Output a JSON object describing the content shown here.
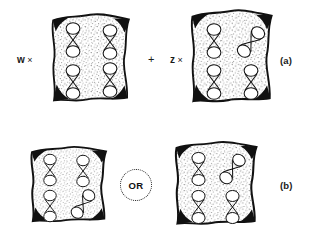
{
  "figure": {
    "background_color": "#ffffff",
    "ink_color": "#111111",
    "stipple_color": "#6b6b6b",
    "rows": [
      {
        "id": "row-a",
        "label": "(a)",
        "operator": "+",
        "items": [
          {
            "id": "cell-a1",
            "parent_label": "w",
            "cross_symbol": "×",
            "chromosome_count": 4,
            "chromosomes": [
              {
                "position": "top-left",
                "orientation": "vertical"
              },
              {
                "position": "top-right",
                "orientation": "vertical"
              },
              {
                "position": "bottom-left",
                "orientation": "vertical"
              },
              {
                "position": "bottom-right",
                "orientation": "vertical"
              }
            ]
          },
          {
            "id": "cell-a2",
            "parent_label": "z",
            "cross_symbol": "×",
            "chromosome_count": 4,
            "chromosomes": [
              {
                "position": "top-left",
                "orientation": "vertical"
              },
              {
                "position": "top-right",
                "orientation": "diagonal"
              },
              {
                "position": "bottom-left",
                "orientation": "vertical"
              },
              {
                "position": "bottom-right",
                "orientation": "vertical"
              }
            ]
          }
        ]
      },
      {
        "id": "row-b",
        "label": "(b)",
        "operator": "OR",
        "items": [
          {
            "id": "cell-b1",
            "parent_label": "",
            "cross_symbol": "",
            "chromosome_count": 4,
            "chromosomes": [
              {
                "position": "top-left",
                "orientation": "vertical"
              },
              {
                "position": "top-right",
                "orientation": "vertical"
              },
              {
                "position": "bottom-left",
                "orientation": "vertical"
              },
              {
                "position": "bottom-right",
                "orientation": "diagonal"
              }
            ]
          },
          {
            "id": "cell-b2",
            "parent_label": "",
            "cross_symbol": "",
            "chromosome_count": 4,
            "chromosomes": [
              {
                "position": "top-left",
                "orientation": "vertical"
              },
              {
                "position": "top-right",
                "orientation": "diagonal"
              },
              {
                "position": "bottom-left",
                "orientation": "vertical"
              },
              {
                "position": "bottom-right",
                "orientation": "vertical"
              }
            ]
          }
        ]
      }
    ],
    "labels": {
      "parent_w": "w",
      "parent_z": "z",
      "cross_symbol": "×",
      "plus_symbol": "+",
      "or_text": "OR",
      "panel_a": "(a)",
      "panel_b": "(b)"
    }
  }
}
